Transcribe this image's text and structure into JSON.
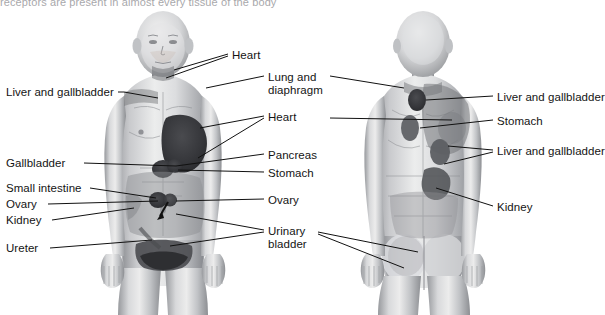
{
  "page": {
    "partial_caption_top": "receptors are present in almost every tissue of the body",
    "background_color": "#ffffff",
    "text_color": "#141414",
    "leader_line_color": "#111111"
  },
  "figures": [
    {
      "id": "anterior-figure",
      "view": "anterior",
      "description": "Anterior (front) view of human body showing referred pain zones"
    },
    {
      "id": "posterior-figure",
      "view": "posterior",
      "description": "Posterior (back) view of human body showing referred pain zones"
    }
  ],
  "labels": {
    "left": [
      {
        "name": "liver-and-gallbladder",
        "text": "Liver and gallbladder",
        "x": 6,
        "y": 86
      },
      {
        "name": "gallbladder",
        "text": "Gallbladder",
        "x": 6,
        "y": 159
      },
      {
        "name": "small-intestine",
        "text": "Small intestine",
        "x": 6,
        "y": 185
      },
      {
        "name": "ovary",
        "text": "Ovary",
        "x": 6,
        "y": 201
      },
      {
        "name": "kidney",
        "text": "Kidney",
        "x": 6,
        "y": 217
      },
      {
        "name": "ureter",
        "text": "Ureter",
        "x": 6,
        "y": 245
      }
    ],
    "center": [
      {
        "name": "heart-upper",
        "text": "Heart",
        "x": 232,
        "y": 50
      },
      {
        "name": "lung-and-diaphragm",
        "text": "Lung and diaphragm",
        "x": 268,
        "y": 72
      },
      {
        "name": "heart-chest",
        "text": "Heart",
        "x": 268,
        "y": 113
      },
      {
        "name": "pancreas",
        "text": "Pancreas",
        "x": 268,
        "y": 151
      },
      {
        "name": "stomach",
        "text": "Stomach",
        "x": 268,
        "y": 169
      },
      {
        "name": "ovary-center",
        "text": "Ovary",
        "x": 268,
        "y": 196
      },
      {
        "name": "urinary-bladder",
        "text": "Urinary bladder",
        "x": 268,
        "y": 229
      }
    ],
    "right": [
      {
        "name": "liver-and-gallbladder-upper",
        "text": "Liver and gallbladder",
        "x": 497,
        "y": 92
      },
      {
        "name": "stomach-back",
        "text": "Stomach",
        "x": 497,
        "y": 116
      },
      {
        "name": "liver-and-gallbladder-mid",
        "text": "Liver and gallbladder",
        "x": 497,
        "y": 146
      },
      {
        "name": "kidney-back",
        "text": "Kidney",
        "x": 497,
        "y": 202
      }
    ]
  }
}
